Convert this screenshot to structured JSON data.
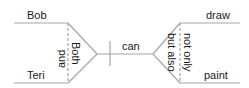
{
  "diagram": {
    "type": "sentence-diagram",
    "sentence": "Both Bob and Teri can not only draw but also paint",
    "subjects": {
      "top": "Bob",
      "bottom": "Teri",
      "conjunction_right": "Both",
      "conjunction_left": "and"
    },
    "verb": {
      "label": "can"
    },
    "predicates": {
      "top": "draw",
      "bottom": "paint",
      "conjunction_right": "not only",
      "conjunction_left": "but also"
    },
    "colors": {
      "line": "#a6a6a6",
      "text": "#1a1a1a",
      "background": "#ffffff"
    }
  }
}
